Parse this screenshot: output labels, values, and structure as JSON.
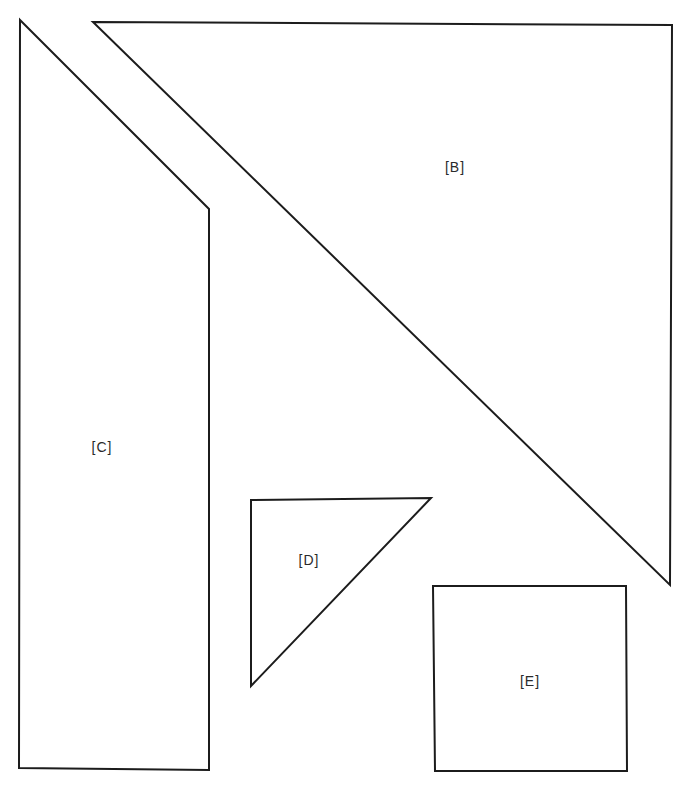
{
  "diagram": {
    "stroke_color": "#1c1c1c",
    "fill_color": "#ffffff",
    "shapes": [
      {
        "id": "C",
        "label": "[C]",
        "type": "pentagon-trapezoid",
        "points": "20,20 209,209 209,770 19,768",
        "label_pos": {
          "x": 102,
          "y": 447
        }
      },
      {
        "id": "B",
        "label": "[B]",
        "type": "right-triangle",
        "points": "93,22 672,25 670,585",
        "label_pos": {
          "x": 455,
          "y": 167
        }
      },
      {
        "id": "D",
        "label": "[D]",
        "type": "right-triangle",
        "points": "251,500 431,498 251,686",
        "label_pos": {
          "x": 309,
          "y": 560
        }
      },
      {
        "id": "E",
        "label": "[E]",
        "type": "square",
        "points": "433,586 626,586 627,771 435,771",
        "label_pos": {
          "x": 530,
          "y": 681
        }
      }
    ]
  }
}
